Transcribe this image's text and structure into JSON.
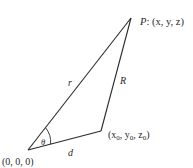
{
  "diagram": {
    "points": {
      "origin": {
        "label": "(0, 0, 0)",
        "x": 28,
        "y": 150
      },
      "P": {
        "label_prefix": "P",
        "label_rest": ": (x, y, z)",
        "x": 131,
        "y": 18
      },
      "source": {
        "label": "(x0, y0, z0)",
        "x": 101,
        "y": 131
      }
    },
    "edges": {
      "r": {
        "label": "r",
        "from": "origin",
        "to": "P"
      },
      "R": {
        "label": "R",
        "from": "source",
        "to": "P"
      },
      "d": {
        "label": "d",
        "from": "origin",
        "to": "source"
      }
    },
    "angle": {
      "label": "θ",
      "at": "origin"
    },
    "labels": {
      "P_name": "P",
      "P_coords": ": (x, y, z)",
      "r": "r",
      "R": "R",
      "d": "d",
      "theta": "θ",
      "origin": "(0, 0, 0)",
      "src_open": "(x",
      "src_sub0a": "0",
      "src_mid1": ", y",
      "src_sub0b": "0",
      "src_mid2": ", z",
      "src_sub0c": "0",
      "src_close": ")"
    },
    "colors": {
      "line": "#2a2a2a",
      "background": "#ffffff"
    }
  }
}
